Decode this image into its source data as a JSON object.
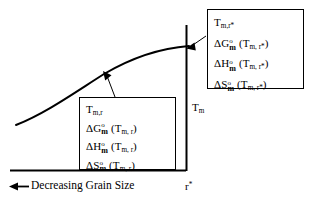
{
  "figure": {
    "type": "schematic-diagram",
    "background": "#ffffff",
    "line_color": "#000000"
  },
  "axes": {
    "vertical_line_label": "T",
    "vertical_line_label_sub": "m",
    "x_tick_label": "r",
    "x_tick_label_sup": "*",
    "x_caption_arrow": "←",
    "x_caption": "Decreasing Grain Size"
  },
  "curve": {
    "description": "melting temperature versus grain size curve, rising and flattening to the right"
  },
  "callouts": [
    {
      "id": "upper",
      "anchor": "curve-intersection-with-Tm-line",
      "lines": [
        {
          "head": "T",
          "head_sub": "m,r*",
          "delta": "",
          "quantity": "",
          "degree": "",
          "arg": ""
        },
        {
          "head": "",
          "head_sub": "",
          "delta": "Δ",
          "quantity": "G",
          "degree": "o",
          "sub": "m",
          "arg": "(T",
          "arg_sub": "m, r*",
          "arg_close": ")"
        },
        {
          "head": "",
          "head_sub": "",
          "delta": "Δ",
          "quantity": "H",
          "degree": "o",
          "sub": "m",
          "arg": "(T",
          "arg_sub": "m, r*",
          "arg_close": ")"
        },
        {
          "head": "",
          "head_sub": "",
          "delta": "Δ",
          "quantity": "S",
          "degree": "o",
          "sub": "m",
          "arg": "(T",
          "arg_sub": "m, r*",
          "arg_close": ")"
        }
      ]
    },
    {
      "id": "lower",
      "anchor": "curve-point-left-of-Tm-line",
      "lines": [
        {
          "head": "T",
          "head_sub": "m,r",
          "delta": "",
          "quantity": "",
          "degree": "",
          "arg": ""
        },
        {
          "head": "",
          "head_sub": "",
          "delta": "Δ",
          "quantity": "G",
          "degree": "o",
          "sub": "m",
          "arg": "(T",
          "arg_sub": "m, r",
          "arg_close": ")"
        },
        {
          "head": "",
          "head_sub": "",
          "delta": "Δ",
          "quantity": "H",
          "degree": "o",
          "sub": "m",
          "arg": "(T",
          "arg_sub": "m, r",
          "arg_close": ")"
        },
        {
          "head": "",
          "head_sub": "",
          "delta": "Δ",
          "quantity": "S",
          "degree": "o",
          "sub": "m",
          "arg": "(T",
          "arg_sub": "m, r",
          "arg_close": ")"
        }
      ]
    }
  ]
}
